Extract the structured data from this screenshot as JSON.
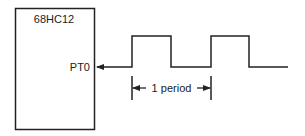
{
  "chip": {
    "name": "68HC12",
    "pin_label": "PT0"
  },
  "waveform": {
    "type": "square-wave",
    "direction": "input-to-pin",
    "pulses": 2
  },
  "period_annotation": {
    "label": "1 period"
  },
  "colors": {
    "stroke": "#222222",
    "background": "#ffffff"
  }
}
